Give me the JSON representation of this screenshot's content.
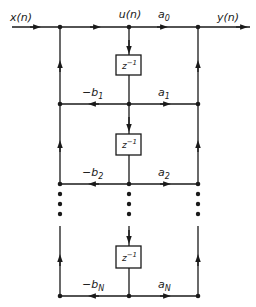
{
  "diagram": {
    "input_label": "x(n)",
    "output_label": "y(n)",
    "state_label": "u(n)",
    "top_gain": {
      "base": "a",
      "sub": "0"
    },
    "delay_label": {
      "base": "z",
      "sup": "−1"
    },
    "rows": [
      {
        "feedback": {
          "base": "−b",
          "sub": "1"
        },
        "feedforward": {
          "base": "a",
          "sub": "1"
        }
      },
      {
        "feedback": {
          "base": "−b",
          "sub": "2"
        },
        "feedforward": {
          "base": "a",
          "sub": "2"
        }
      },
      {
        "feedback": {
          "base": "−b",
          "sub": "N"
        },
        "feedforward": {
          "base": "a",
          "sub": "N"
        }
      }
    ],
    "colors": {
      "line": "#1a1a1a",
      "background": "#ffffff"
    }
  }
}
